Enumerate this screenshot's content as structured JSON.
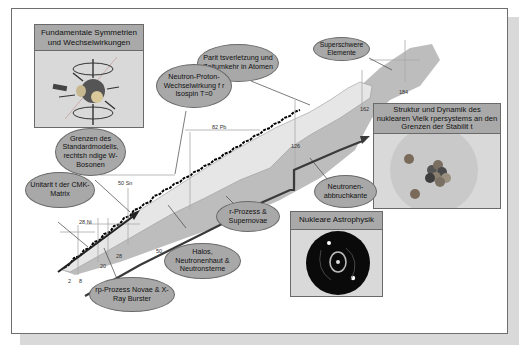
{
  "boxes": {
    "symmetries": {
      "title": "Fundamentale Symmetrien und Wechselwirkungen",
      "icon": "spinning-nucleus-diagram"
    },
    "structure": {
      "title": "Struktur und Dynamik des nuklearen Vielk rpersystems an den Grenzen der Stabilit t",
      "icon": "atomic-nucleus-illustration"
    },
    "astro": {
      "title": "Nukleare Astrophysik",
      "icon": "supernova-image"
    }
  },
  "bubbles": {
    "parity": "Parit tsverletzung und Zeitumkehr in Atomen",
    "superheavy": "Superschwere Elemente",
    "np_interaction": "Neutron-Proton-Wechselwirkung f r Isospin T=0",
    "standard_model": "Grenzen des Standardmodells, rechtsh ndige W-Bosonen",
    "ckm": "Unitarit t der CMK-Matrix",
    "neutron_dripline": "Neutronen-abbruchkante",
    "rprocess": "r-Prozess & Supernovae",
    "halos": "Halos, Neutronenhaut & Neutronsterne",
    "rp_process": "rp-Prozess Novae & X-Ray Burster"
  },
  "chart_labels": {
    "pb": "82 Pb",
    "sn": "50 Sn",
    "ni": "28 Ni",
    "n2": "2",
    "n8": "8",
    "n20": "20",
    "n28": "28",
    "n50": "50",
    "n126": "126",
    "n162": "162",
    "n184": "184"
  },
  "colors": {
    "bubble_fill": "#a8a8a8",
    "header_fill": "#a9a9a9",
    "chart_light": "#e4e4e4",
    "chart_dark": "#bdbdbd",
    "frame_border": "#6e6e6e"
  }
}
